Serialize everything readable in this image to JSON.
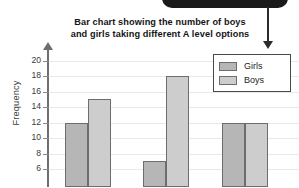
{
  "chart_data": {
    "type": "bar",
    "title": "Bar chart showing the number of boys and girls taking different A level options",
    "title_line1": "Bar chart showing the number of boys",
    "title_line2": "and girls taking different A level options",
    "xlabel": "",
    "ylabel": "Frequency",
    "categories": [
      "",
      "",
      ""
    ],
    "series": [
      {
        "name": "Girls",
        "values": [
          12,
          7,
          12
        ],
        "color": "#b6b6b6"
      },
      {
        "name": "Boys",
        "values": [
          15,
          18,
          12
        ],
        "color": "#cdcdcd"
      }
    ],
    "ylim": [
      4,
      21
    ],
    "yticks": [
      20,
      18,
      16,
      14,
      12,
      10,
      8,
      6
    ],
    "ytick_labels": [
      "20",
      "18",
      "16",
      "14",
      "12",
      "10",
      "8",
      "6"
    ],
    "grid": true,
    "legend_position": "top-right",
    "note": "chart cropped at bottom; x-axis category labels not visible"
  },
  "legend": {
    "items": [
      {
        "label": "Girls"
      },
      {
        "label": "Boys"
      }
    ]
  },
  "annotation": {
    "arrow_target": "legend",
    "banner_text": ""
  }
}
